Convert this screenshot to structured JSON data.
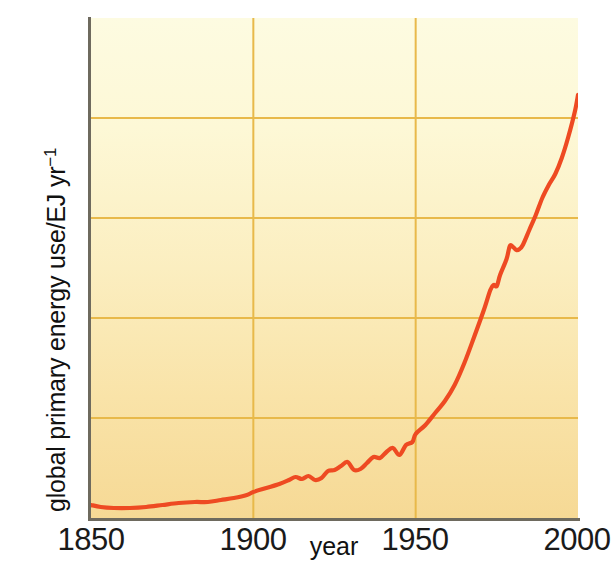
{
  "chart_data": {
    "type": "line",
    "title": "",
    "xlabel": "year",
    "ylabel": "global primary energy use/EJ yr−1",
    "ylabel_text": "global primary energy use/EJ yr",
    "ylabel_exponent": "−1",
    "xlim": [
      1850,
      2000
    ],
    "ylim": [
      0,
      500
    ],
    "xticks": [
      1850,
      1900,
      1950,
      2000
    ],
    "xticklabels": [
      "1850",
      "1900",
      "1950",
      "2000"
    ],
    "yticks": [
      0,
      100,
      200,
      300,
      400,
      500
    ],
    "yticklabels": [
      "0",
      "100",
      "200",
      "300",
      "400",
      "500"
    ],
    "grid": true,
    "grid_color": "#e8b94a",
    "legend": null,
    "line_color": "#ee4a22",
    "line_width": 4.2,
    "background_top_color": "#fdfbe1",
    "background_bottom_color": "#f6d995",
    "axis_color": "#6e6a5e",
    "series": [
      {
        "name": "global primary energy use",
        "units": "EJ yr-1",
        "x": [
          1850,
          1855,
          1860,
          1865,
          1870,
          1875,
          1880,
          1885,
          1890,
          1895,
          1900,
          1905,
          1910,
          1913,
          1915,
          1918,
          1920,
          1923,
          1925,
          1929,
          1932,
          1935,
          1937,
          1940,
          1943,
          1945,
          1947,
          1950,
          1953,
          1956,
          1959,
          1962,
          1965,
          1968,
          1971,
          1973,
          1975,
          1977,
          1979,
          1981,
          1983,
          1985,
          1988,
          1991,
          1994,
          1997,
          2000
        ],
        "y": [
          13,
          11,
          10,
          10,
          11,
          13,
          15,
          16,
          17,
          19,
          22,
          26,
          30,
          33,
          31,
          33,
          32,
          37,
          38,
          43,
          37,
          41,
          45,
          47,
          49,
          44,
          52,
          58,
          64,
          73,
          82,
          93,
          108,
          128,
          148,
          166,
          167,
          181,
          196,
          196,
          195,
          210,
          230,
          247,
          262,
          285,
          300
        ],
        "y_note": "values read from axis; curve plotted in EJ per year",
        "annotations": [
          {
            "label": "start",
            "x": 1850,
            "y": 13
          },
          {
            "label": "end",
            "x": 2000,
            "y": 423
          }
        ]
      }
    ],
    "curve_points_plot_coords": [
      [
        1850,
        13
      ],
      [
        1853,
        11
      ],
      [
        1857,
        10
      ],
      [
        1862,
        10
      ],
      [
        1867,
        11
      ],
      [
        1872,
        13
      ],
      [
        1877,
        15
      ],
      [
        1882,
        16
      ],
      [
        1886,
        16
      ],
      [
        1890,
        18
      ],
      [
        1894,
        20
      ],
      [
        1898,
        23
      ],
      [
        1900,
        26
      ],
      [
        1904,
        30
      ],
      [
        1908,
        34
      ],
      [
        1911,
        38
      ],
      [
        1913,
        41
      ],
      [
        1915,
        39
      ],
      [
        1917,
        42
      ],
      [
        1919,
        38
      ],
      [
        1921,
        40
      ],
      [
        1923,
        47
      ],
      [
        1925,
        48
      ],
      [
        1927,
        52
      ],
      [
        1929,
        56
      ],
      [
        1931,
        48
      ],
      [
        1933,
        49
      ],
      [
        1935,
        55
      ],
      [
        1937,
        61
      ],
      [
        1939,
        60
      ],
      [
        1941,
        66
      ],
      [
        1943,
        70
      ],
      [
        1945,
        63
      ],
      [
        1947,
        73
      ],
      [
        1949,
        76
      ],
      [
        1950,
        84
      ],
      [
        1953,
        93
      ],
      [
        1956,
        105
      ],
      [
        1959,
        117
      ],
      [
        1962,
        133
      ],
      [
        1965,
        155
      ],
      [
        1968,
        181
      ],
      [
        1971,
        208
      ],
      [
        1973,
        228
      ],
      [
        1974,
        233
      ],
      [
        1975,
        232
      ],
      [
        1976,
        243
      ],
      [
        1978,
        259
      ],
      [
        1979,
        272
      ],
      [
        1980,
        271
      ],
      [
        1981,
        268
      ],
      [
        1982,
        269
      ],
      [
        1983,
        273
      ],
      [
        1985,
        288
      ],
      [
        1987,
        303
      ],
      [
        1989,
        320
      ],
      [
        1991,
        333
      ],
      [
        1993,
        344
      ],
      [
        1995,
        360
      ],
      [
        1997,
        381
      ],
      [
        1999,
        406
      ],
      [
        2000,
        423
      ]
    ]
  }
}
